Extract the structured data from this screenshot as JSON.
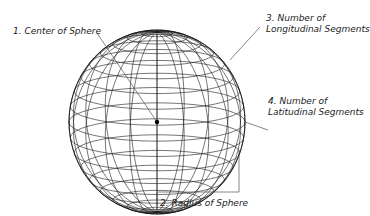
{
  "diagram": {
    "sphere": {
      "cx": 157,
      "cy": 122,
      "rx": 88,
      "ry": 92,
      "longitudinal_segments": 20,
      "latitudinal_segments": 18,
      "tilt_deg": 12,
      "stroke": "#1a1a1a",
      "leader_stroke": "#555555"
    },
    "labels": [
      {
        "id": "center",
        "text": "1. Center of Sphere"
      },
      {
        "id": "radius",
        "text": "2. Radius of Sphere"
      },
      {
        "id": "longitudinal_line1",
        "text": "3. Number of"
      },
      {
        "id": "longitudinal_line2",
        "text": "Longitudinal Segments"
      },
      {
        "id": "latitudinal_line1",
        "text": "4. Number of"
      },
      {
        "id": "latitudinal_line2",
        "text": "Latitudinal Segments"
      }
    ]
  }
}
